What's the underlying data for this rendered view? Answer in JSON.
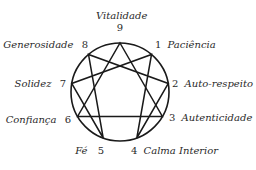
{
  "colors": {
    "line": "#1a1a1a",
    "text": "#2a2a2a",
    "background": "#ffffff"
  },
  "points": [
    {
      "number": "9",
      "label": "Vitalidade"
    },
    {
      "number": "1",
      "label": "Paciência"
    },
    {
      "number": "2",
      "label": "Auto-respeito"
    },
    {
      "number": "3",
      "label": "Autenticidade"
    },
    {
      "number": "4",
      "label": "Calma Interior"
    },
    {
      "number": "5",
      "label": "Fé"
    },
    {
      "number": "6",
      "label": "Confiança"
    },
    {
      "number": "7",
      "label": "Solidez"
    },
    {
      "number": "8",
      "label": "Generosidade"
    }
  ],
  "connections": {
    "triangle": [
      "9",
      "3",
      "6"
    ],
    "hexad": [
      "1",
      "4",
      "2",
      "8",
      "5",
      "7"
    ]
  }
}
